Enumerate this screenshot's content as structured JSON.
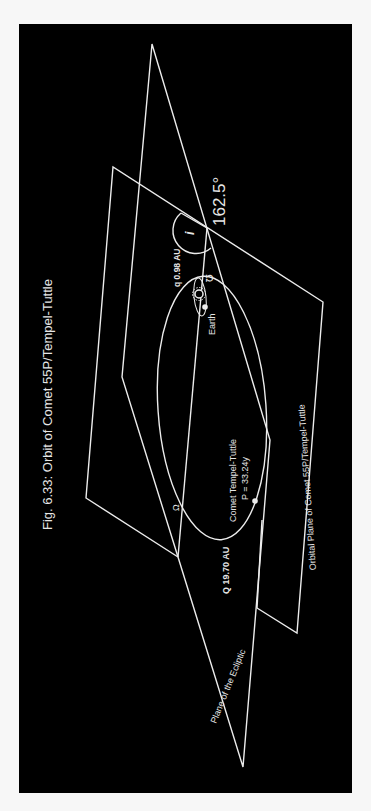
{
  "figure": {
    "title": "Fig. 6.33: Orbit of Comet 55P/Tempel-Tuttle",
    "background_color": "#000000",
    "line_color": "#ececec",
    "orientation": "rotated 90° counter-clockwise"
  },
  "labels": {
    "inclination_symbol": "i",
    "inclination_value": "162.5°",
    "perihelion": "q 0.98 AU",
    "aphelion": "Q 19.70 AU",
    "ascending_node": "Ω",
    "descending_node": "℧",
    "earth": "Earth",
    "comet_name": "Comet Tempel-Tuttle",
    "comet_period": "P = 33.24y",
    "ecliptic_plane": "Plane of the Ecliptic",
    "orbital_plane": "Orbital Plane of Comet 55P/Tempel-Tuttle"
  },
  "icons": {
    "sun": "sun-icon",
    "earth": "earth-dot",
    "comet": "comet-dot"
  }
}
